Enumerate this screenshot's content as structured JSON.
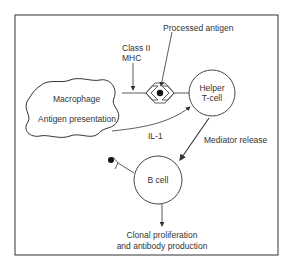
{
  "diagram": {
    "type": "immune-response-flow",
    "labels": {
      "processed_antigen": "Processed antigen",
      "class_ii_line1": "Class II",
      "class_ii_line2": "MHC",
      "macrophage": "Macrophage",
      "antigen_presentation": "Antigen presentation",
      "helper_line1": "Helper",
      "helper_line2": "T-cell",
      "il1": "IL-1",
      "mediator_release": "Mediator release",
      "b_cell": "B cell",
      "clonal_line1": "Clonal proliferation",
      "clonal_line2": "and antibody production"
    },
    "nodes": [
      {
        "id": "macrophage",
        "shape": "cloud",
        "label": "Macrophage / Antigen presentation"
      },
      {
        "id": "mhc_complex",
        "shape": "diamond-with-dot",
        "label": "Class II MHC + Processed antigen"
      },
      {
        "id": "helper_t",
        "shape": "circle",
        "label": "Helper T-cell"
      },
      {
        "id": "b_cell",
        "shape": "circle",
        "label": "B cell"
      },
      {
        "id": "antigen_receptor",
        "shape": "Y-receptor-with-dot",
        "label": ""
      },
      {
        "id": "outcome",
        "shape": "text",
        "label": "Clonal proliferation and antibody production"
      }
    ],
    "edges": [
      {
        "from": "macrophage",
        "to": "helper_t",
        "label": "IL-1"
      },
      {
        "from": "helper_t",
        "to": "b_cell",
        "label": "Mediator release"
      },
      {
        "from": "b_cell",
        "to": "outcome",
        "label": ""
      }
    ],
    "colors": {
      "stroke": "#333333",
      "text": "#333333",
      "background": "#ffffff"
    }
  }
}
